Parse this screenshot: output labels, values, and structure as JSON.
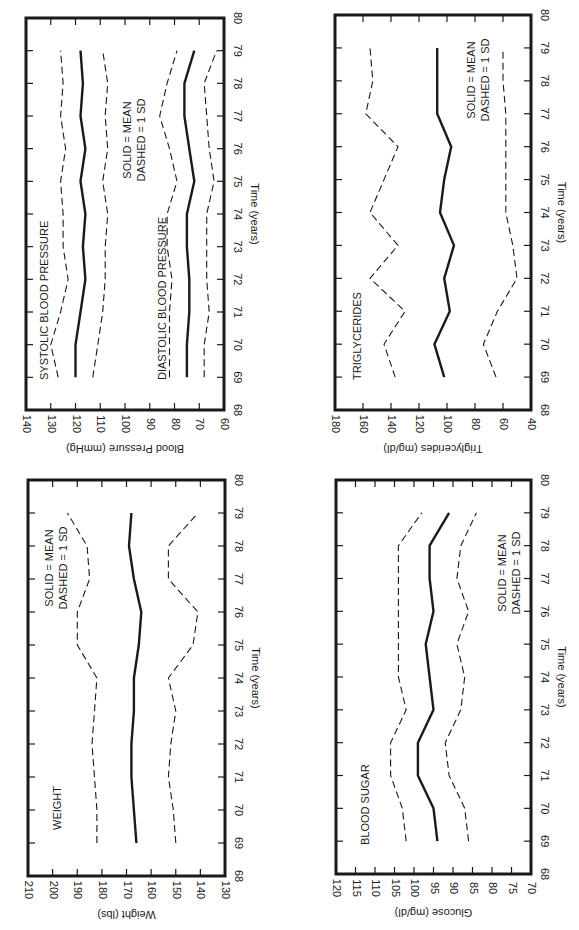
{
  "page": {
    "background": "#ffffff",
    "ink": "#1a1a1a"
  },
  "legend_text": [
    "SOLID = MEAN",
    "DASHED = 1 SD"
  ],
  "chart_data": [
    {
      "id": "blood-pressure",
      "type": "line",
      "orientation": "rotated-90",
      "title": "",
      "annotations": [
        "SYSTOLIC BLOOD PRESSURE",
        "DIASTOLIC BLOOD PRESSURE",
        "SOLID = MEAN",
        "DASHED = 1 SD"
      ],
      "xlabel": "Time (years)",
      "ylabel": "Blood Pressure (mmHg)",
      "xlim": [
        68,
        80
      ],
      "ylim": [
        60,
        140
      ],
      "xticks": [
        68,
        69,
        70,
        71,
        72,
        73,
        74,
        75,
        76,
        77,
        78,
        79,
        80
      ],
      "yticks": [
        60,
        70,
        80,
        90,
        100,
        110,
        120,
        130,
        140
      ],
      "x": [
        69,
        70,
        71,
        72,
        73,
        74,
        75,
        76,
        77,
        78,
        79
      ],
      "series": [
        {
          "name": "Systolic +1 SD",
          "style": "dashed",
          "values": [
            127,
            130,
            126,
            123,
            125,
            125,
            126,
            124,
            126,
            125,
            126
          ]
        },
        {
          "name": "Systolic mean",
          "style": "solid",
          "values": [
            120,
            120,
            118,
            116,
            117,
            116,
            118,
            116,
            118,
            117,
            118
          ]
        },
        {
          "name": "Systolic -1 SD",
          "style": "dashed",
          "values": [
            113,
            111,
            109,
            108,
            108,
            107,
            109,
            107,
            108,
            107,
            109
          ]
        },
        {
          "name": "Diastolic +1 SD",
          "style": "dashed",
          "values": [
            82,
            82,
            82,
            81,
            83,
            83,
            79,
            82,
            86,
            83,
            79
          ]
        },
        {
          "name": "Diastolic mean",
          "style": "solid",
          "values": [
            75,
            75,
            74,
            74,
            75,
            75,
            72,
            74,
            76,
            76,
            72
          ]
        },
        {
          "name": "Diastolic -1 SD",
          "style": "dashed",
          "values": [
            68,
            68,
            66,
            67,
            67,
            67,
            64,
            66,
            67,
            68,
            63
          ]
        }
      ],
      "grid": false,
      "legend": "in-plot text"
    },
    {
      "id": "triglycerides",
      "type": "line",
      "orientation": "rotated-90",
      "title": "",
      "annotations": [
        "TRIGLYCERIDES",
        "SOLID = MEAN",
        "DASHED = 1 SD"
      ],
      "xlabel": "Time (years)",
      "ylabel": "Triglycerides (mg/dl)",
      "xlim": [
        68,
        80
      ],
      "ylim": [
        40,
        180
      ],
      "xticks": [
        68,
        69,
        70,
        71,
        72,
        73,
        74,
        75,
        76,
        77,
        78,
        79,
        80
      ],
      "yticks": [
        40,
        60,
        80,
        100,
        120,
        140,
        160,
        180
      ],
      "x": [
        69,
        70,
        71,
        72,
        73,
        74,
        75,
        76,
        77,
        78,
        79
      ],
      "series": [
        {
          "name": "+1 SD",
          "style": "dashed",
          "values": [
            137,
            145,
            130,
            155,
            135,
            155,
            145,
            135,
            158,
            153,
            155
          ]
        },
        {
          "name": "Mean",
          "style": "solid",
          "values": [
            102,
            109,
            98,
            102,
            95,
            105,
            102,
            97,
            107,
            107,
            107
          ]
        },
        {
          "name": "-1 SD",
          "style": "dashed",
          "values": [
            65,
            74,
            64,
            50,
            53,
            58,
            58,
            58,
            58,
            60,
            60
          ]
        }
      ],
      "grid": false,
      "legend": "in-plot text"
    },
    {
      "id": "weight",
      "type": "line",
      "orientation": "rotated-90",
      "title": "",
      "annotations": [
        "WEIGHT",
        "SOLID = MEAN",
        "DASHED = 1 SD"
      ],
      "xlabel": "Time (years)",
      "ylabel": "Weight (lbs)",
      "xlim": [
        68,
        80
      ],
      "ylim": [
        130,
        210
      ],
      "xticks": [
        68,
        69,
        70,
        71,
        72,
        73,
        74,
        75,
        76,
        77,
        78,
        79,
        80
      ],
      "yticks": [
        130,
        140,
        150,
        160,
        170,
        180,
        190,
        200,
        210
      ],
      "x": [
        69,
        70,
        71,
        72,
        73,
        74,
        75,
        76,
        77,
        78,
        79
      ],
      "series": [
        {
          "name": "+1 SD",
          "style": "dashed",
          "values": [
            182,
            182,
            183,
            184,
            183,
            182,
            190,
            190,
            185,
            186,
            194
          ]
        },
        {
          "name": "Mean",
          "style": "solid",
          "values": [
            166,
            167,
            168,
            168,
            167,
            167,
            165,
            164,
            167,
            169,
            168
          ]
        },
        {
          "name": "-1 SD",
          "style": "dashed",
          "values": [
            150,
            151,
            153,
            152,
            150,
            153,
            143,
            141,
            153,
            153,
            141
          ]
        }
      ],
      "grid": false,
      "legend": "in-plot text"
    },
    {
      "id": "blood-sugar",
      "type": "line",
      "orientation": "rotated-90",
      "title": "",
      "annotations": [
        "BLOOD SUGAR",
        "SOLID = MEAN",
        "DASHED = 1 SD"
      ],
      "xlabel": "Time (years)",
      "ylabel": "Glucose (mg/dl)",
      "xlim": [
        68,
        80
      ],
      "ylim": [
        70,
        120
      ],
      "xticks": [
        68,
        69,
        70,
        71,
        72,
        73,
        74,
        75,
        76,
        77,
        78,
        79,
        80
      ],
      "yticks": [
        70,
        75,
        80,
        85,
        90,
        95,
        100,
        105,
        110,
        115,
        120
      ],
      "x": [
        69,
        70,
        71,
        72,
        73,
        74,
        75,
        76,
        77,
        78,
        79
      ],
      "series": [
        {
          "name": "+1 SD",
          "style": "dashed",
          "values": [
            102,
            103,
            106,
            106,
            102,
            104,
            104,
            104,
            104,
            104,
            98
          ]
        },
        {
          "name": "Mean",
          "style": "solid",
          "values": [
            94,
            95,
            99,
            99,
            95,
            96,
            97,
            95,
            96,
            96,
            91
          ]
        },
        {
          "name": "-1 SD",
          "style": "dashed",
          "values": [
            86,
            87,
            91,
            92,
            88,
            87,
            89,
            86,
            89,
            88,
            84
          ]
        }
      ],
      "grid": false,
      "legend": "in-plot text"
    }
  ],
  "layout": [
    {
      "chart": 0,
      "frame": {
        "left": 26,
        "top": 18,
        "right": 224,
        "bottom": 410
      },
      "labels": [
        {
          "text": "SYSTOLIC BLOOD PRESSURE",
          "x": 45,
          "y": 380,
          "anchor": "start"
        },
        {
          "text": "DIASTOLIC BLOOD PRESSURE",
          "x": 163,
          "y": 380,
          "anchor": "start"
        },
        {
          "text": "SOLID = MEAN",
          "x": 128,
          "y": 140,
          "anchor": "middle"
        },
        {
          "text": "DASHED = 1 SD",
          "x": 142,
          "y": 140,
          "anchor": "middle"
        }
      ]
    },
    {
      "chart": 1,
      "frame": {
        "left": 335,
        "top": 15,
        "right": 531,
        "bottom": 410
      },
      "labels": [
        {
          "text": "TRIGLYCERIDES",
          "x": 358,
          "y": 380,
          "anchor": "start"
        },
        {
          "text": "SOLID = MEAN",
          "x": 472,
          "y": 80,
          "anchor": "middle"
        },
        {
          "text": "DASHED = 1 SD",
          "x": 486,
          "y": 80,
          "anchor": "middle"
        }
      ]
    },
    {
      "chart": 2,
      "frame": {
        "left": 28,
        "top": 480,
        "right": 225,
        "bottom": 876
      },
      "labels": [
        {
          "text": "WEIGHT",
          "x": 58,
          "y": 830,
          "anchor": "start"
        },
        {
          "text": "SOLID = MEAN",
          "x": 50,
          "y": 568,
          "anchor": "middle"
        },
        {
          "text": "DASHED = 1 SD",
          "x": 64,
          "y": 568,
          "anchor": "middle"
        }
      ]
    },
    {
      "chart": 3,
      "frame": {
        "left": 336,
        "top": 480,
        "right": 531,
        "bottom": 874
      },
      "labels": [
        {
          "text": "BLOOD SUGAR",
          "x": 366,
          "y": 845,
          "anchor": "start"
        },
        {
          "text": "SOLID = MEAN",
          "x": 503,
          "y": 573,
          "anchor": "middle"
        },
        {
          "text": "DASHED = 1 SD",
          "x": 517,
          "y": 573,
          "anchor": "middle"
        }
      ]
    }
  ]
}
